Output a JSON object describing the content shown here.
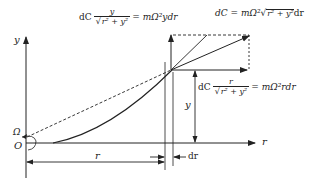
{
  "figure": {
    "axes": {
      "y_label": "y",
      "x_label": "r",
      "origin_label": "O",
      "omega_label": "Ω"
    },
    "dimensions": {
      "r_label": "r",
      "y_label": "y",
      "dr_label": "dr"
    },
    "equations": {
      "vertical_component": {
        "lhs_prefix": "dC",
        "numerator": "y",
        "denominator_root": "r² + y²",
        "rhs": "= mΩ²ydr"
      },
      "total": {
        "lhs": "dC = mΩ²",
        "root": "r² + y²",
        "suffix": "dr"
      },
      "horizontal_component": {
        "lhs_prefix": "dC",
        "numerator": "r",
        "denominator_root": "r² + y²",
        "rhs": "= mΩ²rdr"
      }
    },
    "colors": {
      "line": "#222222",
      "background": "#ffffff"
    }
  }
}
